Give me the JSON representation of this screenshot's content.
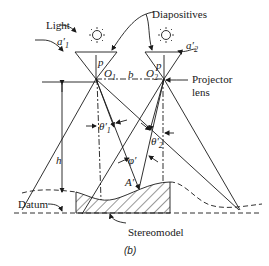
{
  "figure": {
    "caption": "(b)",
    "labels": {
      "light": "Light",
      "diapositives": "Diapositives",
      "projector": "Projector",
      "lens": "lens",
      "datum": "Datum",
      "stereomodel": "Stereomodel",
      "a1": "a′1",
      "a2": "a′2",
      "p1": "p",
      "p2": "p",
      "o1": "O1",
      "o2": "O2",
      "b": "b",
      "h": "h",
      "theta1": "θ′1",
      "theta2": "θ′2",
      "phi": "φ′",
      "a_prime": "A′"
    }
  }
}
